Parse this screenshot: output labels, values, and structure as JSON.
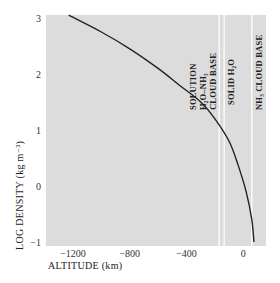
{
  "chart_data": {
    "type": "line",
    "title": "",
    "xlabel": "ALTITUDE (km)",
    "ylabel": "LOG DENSITY (kg m⁻³)",
    "xlim": [
      -1390,
      160
    ],
    "ylim": [
      -1,
      3
    ],
    "xticks": [
      -1200,
      -800,
      -400,
      0
    ],
    "xtick_labels": [
      "−1200",
      "−800",
      "−400",
      "0"
    ],
    "yticks": [
      3,
      2,
      1,
      0,
      -1
    ],
    "ytick_labels": [
      "3",
      "2",
      "1",
      "0",
      "−1"
    ],
    "grid": false,
    "background": "#dcdcdc",
    "series": [
      {
        "name": "density profile",
        "color": "#222222",
        "x": [
          -1230,
          -1000,
          -800,
          -600,
          -450,
          -300,
          -200,
          -100,
          -40,
          20,
          60,
          75
        ],
        "y": [
          3.05,
          2.75,
          2.45,
          2.1,
          1.8,
          1.5,
          1.2,
          0.8,
          0.4,
          -0.1,
          -0.6,
          -1.0
        ]
      }
    ],
    "vlines": [
      {
        "x": -170,
        "label_lines": [
          "SOLUTION",
          "H₂O–NH₃",
          "CLOUD BASE"
        ],
        "color": "#ffffff"
      },
      {
        "x": -135,
        "label_lines": [
          "SOLID H₂O"
        ],
        "color": "#ffffff"
      },
      {
        "x": 60,
        "label_lines": [
          "NH₃ CLOUD BASE"
        ],
        "color": "#ffffff"
      }
    ]
  }
}
